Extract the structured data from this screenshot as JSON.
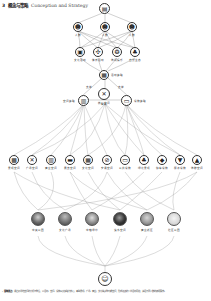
{
  "header": {
    "section_number": "3",
    "title_cn": "概念与策略",
    "title_en": "Conception and Strategy"
  },
  "top": {
    "root": {
      "icon": "building-icon",
      "glyph": "▤"
    },
    "tier1": [
      {
        "icon": "person-icon",
        "glyph": "☻",
        "label": "人群"
      },
      {
        "icon": "person-icon",
        "glyph": "☻",
        "label": "人群"
      },
      {
        "icon": "person-icon",
        "glyph": "☻",
        "label": "人群"
      }
    ],
    "tier2": [
      {
        "icon": "building-icon",
        "glyph": "▣",
        "label": "文化活动"
      },
      {
        "icon": "sport-icon",
        "glyph": "✣",
        "label": "体育活动"
      },
      {
        "icon": "brain-icon",
        "glyph": "❂",
        "label": "休闲娱乐"
      },
      {
        "icon": "tree-icon",
        "glyph": "♣",
        "label": "自然生态"
      }
    ]
  },
  "middle": {
    "hub": {
      "icon": "calendar-icon",
      "glyph": "▦",
      "label": "活动策略"
    },
    "center": {
      "icon": "tools-icon",
      "glyph": "✕",
      "label": "核心空间"
    },
    "left": {
      "icon": "grid-icon",
      "glyph": "▥",
      "label": "空间策略"
    },
    "right": {
      "icon": "screen-icon",
      "glyph": "▭",
      "label": "设施策略"
    },
    "edge_labels": [
      "支撑",
      "支撑",
      "联动"
    ]
  },
  "functions": [
    {
      "icon": "map-icon",
      "glyph": "▩",
      "label": "景观空间"
    },
    {
      "icon": "cross-icon",
      "glyph": "✕",
      "label": "广场空间"
    },
    {
      "icon": "market-icon",
      "glyph": "▥",
      "label": "商业空间"
    },
    {
      "icon": "window-icon",
      "glyph": "▬",
      "label": "展览空间"
    },
    {
      "icon": "board-icon",
      "glyph": "▦",
      "label": "文化空间"
    },
    {
      "icon": "no-icon",
      "glyph": "⊘",
      "label": "交通空间"
    },
    {
      "icon": "bus-icon",
      "glyph": "▭",
      "label": "公共设施"
    },
    {
      "icon": "leaf-icon",
      "glyph": "♣",
      "label": "绿化景观"
    },
    {
      "icon": "car-icon",
      "glyph": "◆",
      "label": "停车设施"
    },
    {
      "icon": "cart-icon",
      "glyph": "▼",
      "label": "服务设施"
    },
    {
      "icon": "tent-icon",
      "glyph": "▲",
      "label": "休憩空间"
    }
  ],
  "sites": [
    {
      "label": "中央公园",
      "tone": "#6a6a6a"
    },
    {
      "label": "文化广场",
      "tone": "#7a7a7a"
    },
    {
      "label": "中轴绿带",
      "tone": "#8c8c8c"
    },
    {
      "label": "滨水空间",
      "tone": "#3a3a3a"
    },
    {
      "label": "商业街区",
      "tone": "#9a9a9a"
    },
    {
      "label": "社区公园",
      "tone": "#d8d8d8"
    }
  ],
  "bottom": {
    "icon": "people-icon",
    "glyph": "☺",
    "label": "目标"
  },
  "footer": {
    "key": "· 策略要点：",
    "text": "通过对场地空间的分析与整合，以活动、空间、设施三大策略为核心，串联景观、广场、商业、文化等多种功能空间，形成连续的公共活动网络，满足不同人群的使用需求。"
  }
}
